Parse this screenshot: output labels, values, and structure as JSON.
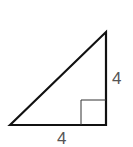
{
  "diagram": {
    "type": "right-triangle",
    "vertical_side_label": "4",
    "horizontal_side_label": "4",
    "right_angle_marker": true,
    "colors": {
      "stroke": "#111111",
      "label": "#555555",
      "background": "#ffffff"
    }
  }
}
